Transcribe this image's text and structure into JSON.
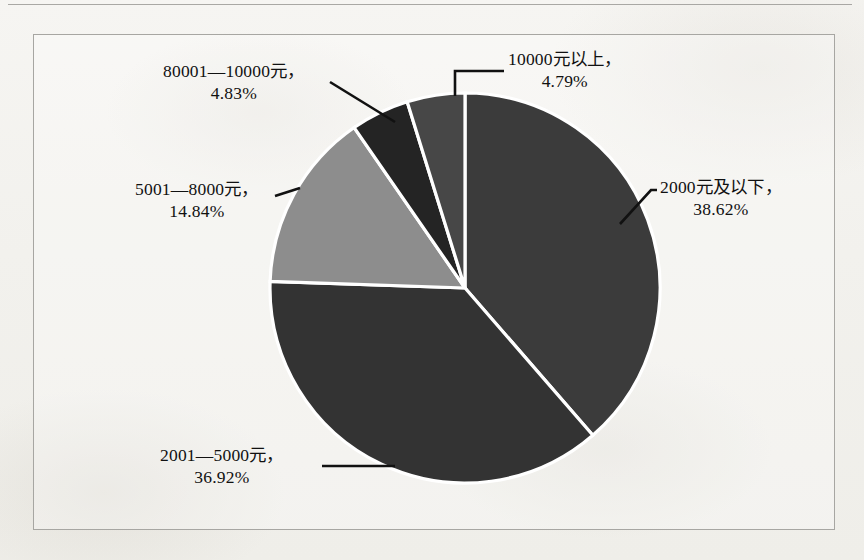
{
  "figure": {
    "background_color": "#f3f2ee",
    "frame_color": "#a7a6a2",
    "label_color": "#111111",
    "slice_border_color": "#ffffff"
  },
  "chart_data": {
    "type": "pie",
    "title": "",
    "xlabel": "",
    "ylabel": "",
    "legend": "none",
    "labels_position": "outside-with-leader-lines",
    "categories": [
      "2000元及以下",
      "2001—5000元",
      "5001—8000元",
      "80001—10000元",
      "10000元以上"
    ],
    "values": [
      38.62,
      36.92,
      14.84,
      4.83,
      4.79
    ],
    "value_suffix": "%",
    "colors": [
      "#3b3b3b",
      "#333333",
      "#8d8d8d",
      "#242424",
      "#474747"
    ],
    "slices": [
      {
        "category": "2000元及以下",
        "value": 38.62,
        "value_text": "38.62%",
        "label_line1": "2000元及以下，",
        "label_line2": "38.62%",
        "color": "#3b3b3b",
        "start_angle_deg": 0,
        "sweep_deg": 139.03
      },
      {
        "category": "2001—5000元",
        "value": 36.92,
        "value_text": "36.92%",
        "label_line1": "2001—5000元，",
        "label_line2": "36.92%",
        "color": "#333333",
        "start_angle_deg": 139.03,
        "sweep_deg": 132.91
      },
      {
        "category": "5001—8000元",
        "value": 14.84,
        "value_text": "14.84%",
        "label_line1": "5001—8000元，",
        "label_line2": "14.84%",
        "color": "#8d8d8d",
        "start_angle_deg": 271.94,
        "sweep_deg": 53.42
      },
      {
        "category": "80001—10000元",
        "value": 4.83,
        "value_text": "4.83%",
        "label_line1": "80001—10000元，",
        "label_line2": "4.83%",
        "color": "#242424",
        "start_angle_deg": 325.36,
        "sweep_deg": 17.39
      },
      {
        "category": "10000元以上",
        "value": 4.79,
        "value_text": "4.79%",
        "label_line1": "10000元以上，",
        "label_line2": "4.79%",
        "color": "#474747",
        "start_angle_deg": 342.75,
        "sweep_deg": 17.24
      }
    ],
    "total": 100.0,
    "geometry": {
      "center_x": 465,
      "center_y": 288,
      "radius": 195
    }
  }
}
